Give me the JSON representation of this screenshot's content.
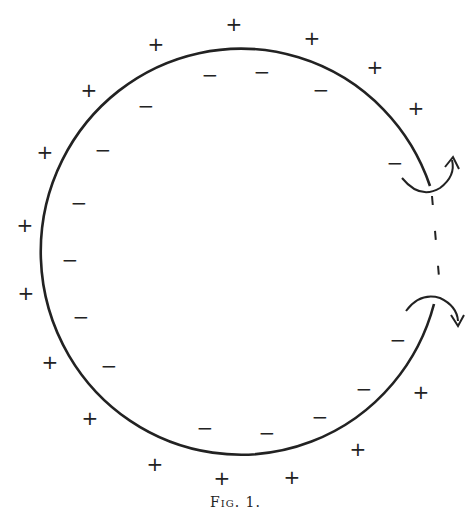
{
  "figure": {
    "caption": "Fig. 1.",
    "stroke_color": "#222222",
    "background": "#ffffff"
  },
  "diagram": {
    "shape": "open circle (ring with gap on right side)",
    "center": [
      242,
      252
    ],
    "radius": 203,
    "gap": {
      "start": [
        430,
        186
      ],
      "end": [
        434,
        304
      ],
      "style": "dashed"
    },
    "arrows": [
      {
        "name": "upper-curved-arrow",
        "direction": "curving up-right",
        "position": [
          430,
          180
        ]
      },
      {
        "name": "lower-curved-arrow",
        "direction": "curving down-right",
        "position": [
          437,
          310
        ]
      }
    ],
    "outer_charges": {
      "symbol": "+",
      "points": [
        [
          156,
          44
        ],
        [
          234,
          24
        ],
        [
          312,
          38
        ],
        [
          375,
          67
        ],
        [
          416,
          108
        ],
        [
          89,
          90
        ],
        [
          45,
          152
        ],
        [
          25,
          225
        ],
        [
          26,
          293
        ],
        [
          50,
          362
        ],
        [
          90,
          418
        ],
        [
          155,
          464
        ],
        [
          222,
          478
        ],
        [
          292,
          477
        ],
        [
          358,
          449
        ],
        [
          421,
          392
        ]
      ]
    },
    "inner_charges": {
      "symbol": "−",
      "points": [
        [
          210,
          75
        ],
        [
          262,
          72
        ],
        [
          321,
          90
        ],
        [
          146,
          106
        ],
        [
          103,
          150
        ],
        [
          395,
          163
        ],
        [
          79,
          203
        ],
        [
          70,
          260
        ],
        [
          81,
          317
        ],
        [
          109,
          366
        ],
        [
          205,
          428
        ],
        [
          267,
          433
        ],
        [
          320,
          417
        ],
        [
          364,
          389
        ],
        [
          398,
          340
        ]
      ]
    }
  }
}
